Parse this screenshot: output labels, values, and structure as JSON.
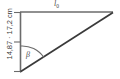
{
  "figure": {
    "type": "geometry-diagram",
    "shape": "right-triangle",
    "background_color": "#ffffff",
    "line_color_top": "#6b6b6b",
    "line_color_left": "#6b6b6b",
    "line_color_hypotenuse": "#3a3a3a",
    "arc_color": "#6b6b6b",
    "text_color": "#4a4a4a",
    "labels": {
      "top_side": "l",
      "top_side_subscript": "0",
      "left_side": "14,87 · 17,2 cm",
      "angle": "β"
    },
    "geometry": {
      "vertex_top_left": [
        20,
        12
      ],
      "vertex_top_right": [
        113,
        13
      ],
      "vertex_bottom_left": [
        20,
        72
      ],
      "tick_marks_left_side_y": [
        12,
        42,
        72
      ],
      "arc_radius": 26,
      "arc_center": [
        20,
        72
      ]
    }
  }
}
